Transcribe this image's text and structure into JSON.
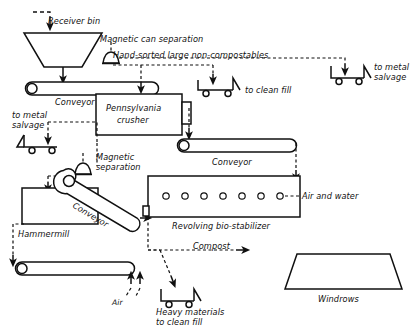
{
  "diagram": {
    "stroke_color": "#101010",
    "background_color": "#ffffff",
    "nodes": {
      "receiver_bin": {
        "label": "Receiver bin",
        "shape": "hopper"
      },
      "conveyor_1": {
        "label": "Conveyor",
        "shape": "belt-conveyor"
      },
      "magnetic_can_separation": {
        "label": "Magnetic can separation",
        "shape": "magnet-bell"
      },
      "hand_sorted": {
        "label": "Hand-sorted large non-compostables",
        "shape": "annotation"
      },
      "to_clean_fill_cart": {
        "label": "to clean fill",
        "shape": "cart"
      },
      "to_metal_salvage_right": {
        "label": "to metal\nsalvage",
        "line1": "to metal",
        "line2": "salvage",
        "shape": "cart"
      },
      "pennsylvania_crusher": {
        "label": "Pennsylvania\ncrusher",
        "line1": "Pennsylvania",
        "line2": "crusher",
        "shape": "box"
      },
      "conveyor_2": {
        "label": "Conveyor",
        "shape": "belt-conveyor"
      },
      "magnetic_separation": {
        "label": "Magnetic\nseparation",
        "line1": "Magnetic",
        "line2": "separation",
        "shape": "magnet-bell"
      },
      "to_metal_salvage_left": {
        "label": "to metal\nsalvage",
        "line1": "to metal",
        "line2": "salvage",
        "shape": "cart"
      },
      "hammermill": {
        "label": "Hammermill",
        "shape": "box"
      },
      "conveyor_3": {
        "label": "Conveyor",
        "shape": "inclined-belt-conveyor"
      },
      "revolving_bio_stabilizer": {
        "label": "Revolving bio-stabilizer",
        "shape": "drum-box",
        "port_count": 7
      },
      "air_and_water": {
        "label": "Air and water",
        "shape": "annotation"
      },
      "conveyor_4": {
        "label": "",
        "shape": "belt-conveyor"
      },
      "air": {
        "label": "Air",
        "shape": "annotation"
      },
      "heavy_materials": {
        "label": "Heavy materials\nto clean fill",
        "line1": "Heavy materials",
        "line2": "to clean fill",
        "shape": "cart"
      },
      "compost": {
        "label": "Compost",
        "shape": "annotation"
      },
      "windrows": {
        "label": "Windrows",
        "shape": "trapezoid"
      }
    }
  }
}
